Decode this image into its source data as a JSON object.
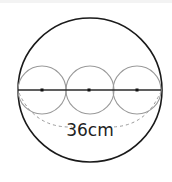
{
  "diagram": {
    "measurement_label": "36cm",
    "colors": {
      "outer_circle": "#1a1a1a",
      "inner_circles": "#9a9a9a",
      "diameter_line": "#2a2a2a",
      "center_dots": "#111111",
      "dashed_arc": "#9a9a9a",
      "label": "#222222"
    },
    "outer_circle": {
      "cx": 90,
      "cy": 90,
      "r": 72
    },
    "inner_circles": [
      {
        "cx": 42,
        "cy": 90,
        "r": 24
      },
      {
        "cx": 90,
        "cy": 90,
        "r": 24
      },
      {
        "cx": 137,
        "cy": 90,
        "r": 24
      }
    ]
  }
}
